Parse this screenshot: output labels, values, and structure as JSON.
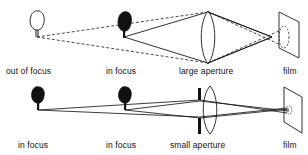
{
  "diagram": {
    "top_row": {
      "labels": {
        "out_of_focus": "out of focus",
        "in_focus": "in focus",
        "aperture": "large aperture",
        "film": "film"
      }
    },
    "bottom_row": {
      "labels": {
        "in_focus_1": "in focus",
        "in_focus_2": "in focus",
        "aperture": "small aperture",
        "film": "film"
      }
    },
    "colors": {
      "line": "#1a1a1a",
      "background": "#ffffff"
    }
  }
}
